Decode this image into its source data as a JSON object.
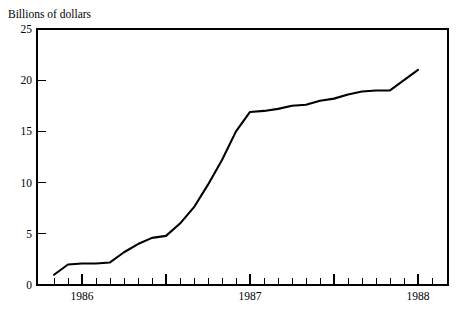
{
  "chart_data": {
    "type": "line",
    "title": "",
    "subtitle": "",
    "ylabel": "Billions of dollars",
    "xlabel": "",
    "ylim": [
      0,
      25
    ],
    "yticks": [
      0,
      5,
      10,
      15,
      20,
      25
    ],
    "yticklabels": [
      "0",
      "5",
      "10",
      "15",
      "20",
      "25"
    ],
    "xlim": [
      "1985-10",
      "1988-02"
    ],
    "xticklabels": [
      "1986",
      "1987",
      "1988"
    ],
    "xtick_positions_month": [
      "1986-01",
      "1987-01",
      "1988-01"
    ],
    "x_minor_ticks": "monthly",
    "grid": false,
    "legend": null,
    "legend_position": "none",
    "series": [
      {
        "name": "Billions of dollars",
        "x": [
          "1985-11",
          "1985-12",
          "1986-01",
          "1986-02",
          "1986-03",
          "1986-04",
          "1986-05",
          "1986-06",
          "1986-07",
          "1986-08",
          "1986-09",
          "1986-10",
          "1986-11",
          "1986-12",
          "1987-01",
          "1987-02",
          "1987-03",
          "1987-04",
          "1987-05",
          "1987-06",
          "1987-07",
          "1987-08",
          "1987-09",
          "1987-10",
          "1987-11",
          "1987-12",
          "1988-01"
        ],
        "values": [
          1.0,
          2.0,
          2.1,
          2.1,
          2.2,
          3.2,
          4.0,
          4.6,
          4.8,
          6.0,
          7.6,
          9.8,
          12.2,
          15.0,
          16.9,
          17.0,
          17.2,
          17.5,
          17.6,
          18.0,
          18.2,
          18.6,
          18.9,
          19.0,
          19.0,
          20.0,
          21.0
        ]
      }
    ]
  },
  "geometry": {
    "plot_left": 37,
    "plot_right": 448,
    "plot_top": 29,
    "plot_bottom": 285,
    "month_width": 14.0,
    "x_origin_1986_01": 82
  },
  "colors": {
    "line": "#000000",
    "axis": "#000000",
    "background": "#ffffff"
  }
}
